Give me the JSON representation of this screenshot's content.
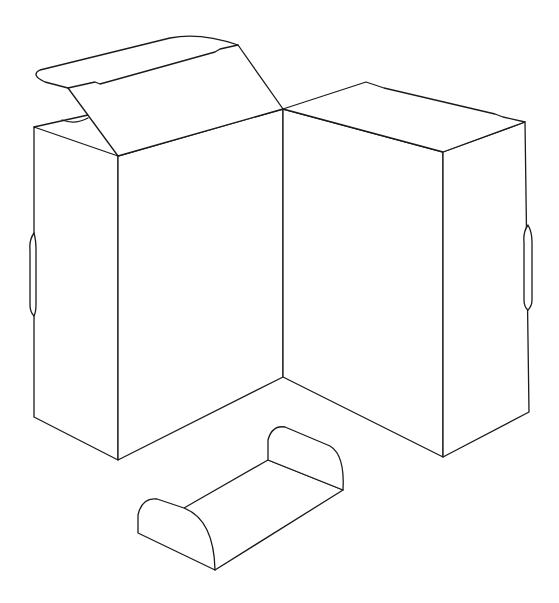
{
  "figure": {
    "stroke_color": "#1a1a1a",
    "background": "#ffffff"
  },
  "parts": [
    {
      "name": "open-carton",
      "features": [
        "flip-top lid",
        "side hand slot"
      ]
    },
    {
      "name": "closed-carton",
      "features": [
        "side hand slot"
      ]
    },
    {
      "name": "tray-insert",
      "features": [
        "rounded end walls"
      ]
    }
  ]
}
